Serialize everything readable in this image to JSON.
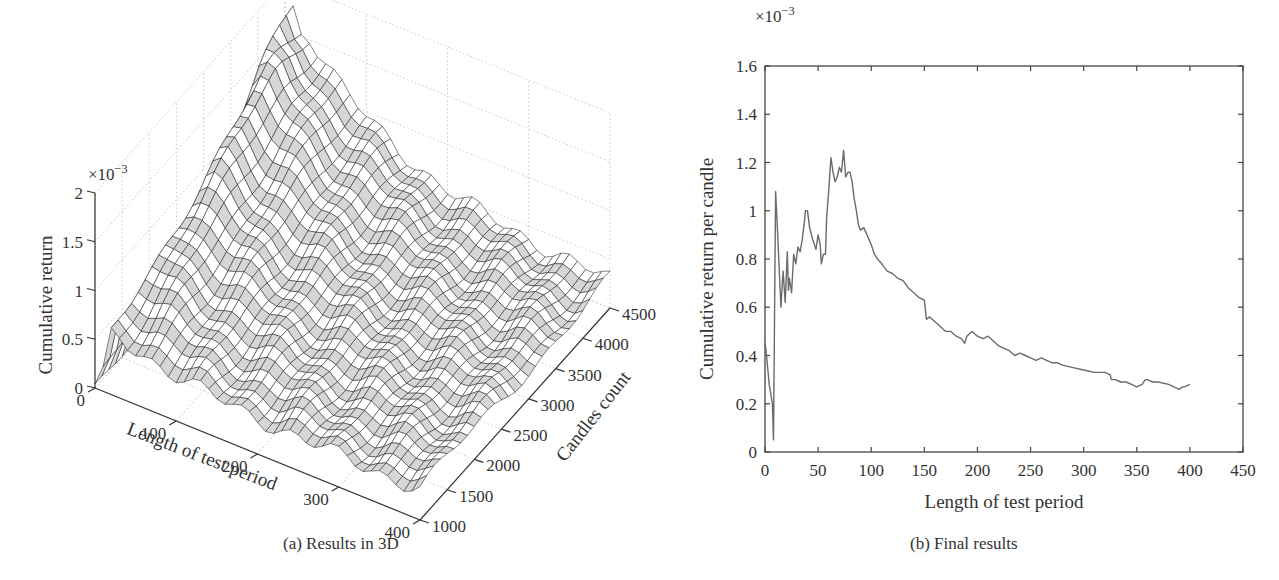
{
  "figure": {
    "panel_a": {
      "caption": "(a)  Results in 3D"
    },
    "panel_b": {
      "caption": "(b)  Final results"
    }
  },
  "chart_data": [
    {
      "type": "surface3d",
      "title": "",
      "caption": "(a) Results in 3D",
      "xlabel": "Length of test period",
      "ylabel": "Candles count",
      "zlabel": "Cumulative return",
      "z_multiplier": "×10^-3",
      "x_ticks": [
        "0",
        "100",
        "200",
        "300",
        "400"
      ],
      "y_ticks": [
        "1000",
        "1500",
        "2000",
        "2500",
        "3000",
        "3500",
        "4000",
        "4500"
      ],
      "z_ticks": [
        "0",
        "0.5",
        "1",
        "1.5",
        "2"
      ],
      "xlim": [
        0,
        400
      ],
      "ylim": [
        1000,
        4500
      ],
      "zlim": [
        0,
        2
      ],
      "grid": true,
      "description": "Mesh surface; high ridge (~1.3-1.6e-3) at short test periods (<60) for mid-to-high candle counts, decaying to ~0.3e-3 at long test periods"
    },
    {
      "type": "line",
      "title": "",
      "caption": "(b) Final results",
      "xlabel": "Length of test period",
      "ylabel": "Cumulative return per candle",
      "y_multiplier": "×10^-3",
      "xlim": [
        0,
        450
      ],
      "ylim": [
        0,
        1.6
      ],
      "x_ticks": [
        "0",
        "50",
        "100",
        "150",
        "200",
        "250",
        "300",
        "350",
        "400",
        "450"
      ],
      "y_ticks": [
        "0",
        "0.2",
        "0.4",
        "0.6",
        "0.8",
        "1",
        "1.2",
        "1.4",
        "1.6"
      ],
      "grid": false,
      "series": [
        {
          "name": "Cumulative return per candle",
          "color": "#6b6b6b",
          "x": [
            1,
            4,
            7,
            8,
            10,
            12,
            15,
            17,
            19,
            21,
            22,
            23,
            25,
            27,
            29,
            31,
            33,
            35,
            37,
            38,
            40,
            42,
            45,
            48,
            50,
            52,
            53,
            55,
            57,
            58,
            60,
            62,
            64,
            66,
            68,
            70,
            72,
            74,
            76,
            78,
            80,
            82,
            84,
            86,
            88,
            90,
            93,
            96,
            100,
            103,
            106,
            110,
            115,
            120,
            125,
            130,
            135,
            140,
            145,
            150,
            152,
            155,
            160,
            165,
            170,
            175,
            180,
            185,
            188,
            190,
            195,
            200,
            205,
            210,
            215,
            220,
            225,
            230,
            235,
            240,
            245,
            250,
            255,
            260,
            265,
            270,
            275,
            280,
            290,
            300,
            310,
            320,
            325,
            326,
            330,
            335,
            340,
            345,
            350,
            355,
            358,
            360,
            365,
            370,
            380,
            390,
            393,
            395,
            400
          ],
          "y": [
            0.42,
            0.28,
            0.2,
            0.05,
            1.08,
            0.9,
            0.6,
            0.75,
            0.62,
            0.83,
            0.67,
            0.72,
            0.66,
            0.82,
            0.78,
            0.85,
            0.83,
            0.88,
            0.95,
            1.0,
            1.0,
            0.93,
            0.88,
            0.84,
            0.9,
            0.86,
            0.78,
            0.82,
            0.82,
            0.97,
            1.08,
            1.22,
            1.16,
            1.12,
            1.14,
            1.18,
            1.16,
            1.25,
            1.14,
            1.16,
            1.16,
            1.12,
            1.05,
            1.0,
            0.94,
            0.92,
            0.93,
            0.9,
            0.86,
            0.82,
            0.8,
            0.78,
            0.75,
            0.74,
            0.72,
            0.71,
            0.68,
            0.66,
            0.64,
            0.63,
            0.55,
            0.56,
            0.54,
            0.52,
            0.5,
            0.5,
            0.48,
            0.47,
            0.45,
            0.48,
            0.5,
            0.48,
            0.47,
            0.48,
            0.46,
            0.44,
            0.43,
            0.42,
            0.4,
            0.41,
            0.4,
            0.39,
            0.38,
            0.39,
            0.38,
            0.37,
            0.37,
            0.36,
            0.35,
            0.34,
            0.33,
            0.33,
            0.32,
            0.3,
            0.3,
            0.29,
            0.29,
            0.28,
            0.27,
            0.28,
            0.3,
            0.3,
            0.29,
            0.29,
            0.28,
            0.26,
            0.27,
            0.27,
            0.28
          ]
        }
      ]
    }
  ]
}
